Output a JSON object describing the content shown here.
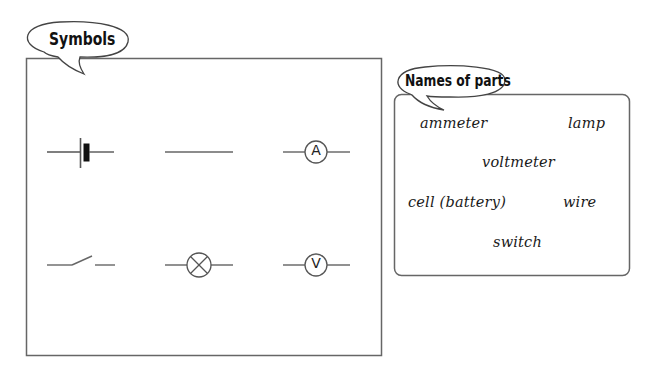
{
  "symbols_panel": {
    "title": "Symbols",
    "symbols": [
      {
        "id": "cell",
        "depicts": "cell-battery-symbol",
        "row": 1,
        "col": 1
      },
      {
        "id": "wire",
        "depicts": "wire-symbol",
        "row": 1,
        "col": 2
      },
      {
        "id": "ammeter",
        "depicts": "ammeter-symbol",
        "row": 1,
        "col": 3,
        "letter": "A"
      },
      {
        "id": "switch",
        "depicts": "open-switch-symbol",
        "row": 2,
        "col": 1
      },
      {
        "id": "lamp",
        "depicts": "lamp-symbol",
        "row": 2,
        "col": 2
      },
      {
        "id": "voltmeter",
        "depicts": "voltmeter-symbol",
        "row": 2,
        "col": 3,
        "letter": "V"
      }
    ]
  },
  "names_panel": {
    "title": "Names of parts",
    "words": [
      {
        "text": "ammeter"
      },
      {
        "text": "lamp"
      },
      {
        "text": "voltmeter"
      },
      {
        "text": "cell (battery)"
      },
      {
        "text": "wire"
      },
      {
        "text": "switch"
      }
    ]
  },
  "colors": {
    "line": "#555555",
    "stroke_dark": "#333333",
    "text": "#111111",
    "background": "#ffffff"
  }
}
